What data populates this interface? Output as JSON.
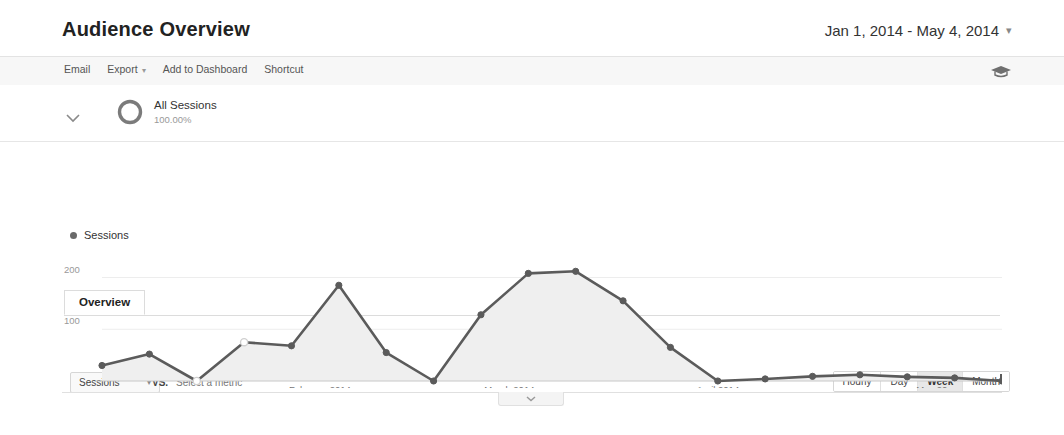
{
  "header": {
    "title": "Audience Overview",
    "date_range": "Jan 1, 2014 - May 4, 2014",
    "date_range_caret": "▾"
  },
  "toolbar": {
    "items": [
      {
        "label": "Email",
        "has_caret": false
      },
      {
        "label": "Export",
        "has_caret": true
      },
      {
        "label": "Add to Dashboard",
        "has_caret": false
      },
      {
        "label": "Shortcut",
        "has_caret": false
      }
    ],
    "export_caret": "▾",
    "help_icon": "graduation-cap-icon"
  },
  "segment": {
    "chevron_icon": "chevron-down-icon",
    "ring_icon": "donut-ring-icon",
    "name": "All Sessions",
    "percent": "100.00%"
  },
  "tabs": [
    {
      "label": "Overview",
      "active": true
    }
  ],
  "metric_controls": {
    "selected_metric": "Sessions",
    "metric_caret": "▾",
    "vs_label": "VS.",
    "compare_placeholder": "Select a metric",
    "granularity": [
      {
        "label": "Hourly",
        "active": false
      },
      {
        "label": "Day",
        "active": false
      },
      {
        "label": "Week",
        "active": true
      },
      {
        "label": "Month",
        "active": false
      }
    ]
  },
  "legend": {
    "series_label": "Sessions",
    "dot_color": "#6a6a6a"
  },
  "colors": {
    "line": "#5b5b5b",
    "fill": "#efefef",
    "axis": "#c8c8c8",
    "grid": "#ededed",
    "marker": "#5b5b5b",
    "marker_zero": "#ffffff"
  },
  "chart_data": {
    "type": "area",
    "title": "",
    "xlabel": "",
    "ylabel": "Sessions",
    "ylim": [
      0,
      230
    ],
    "yticks": [
      100,
      200
    ],
    "ytick_labels": [
      "100",
      "200"
    ],
    "grid": true,
    "legend_position": "top-left",
    "x_axis_labels": [
      {
        "label": "February 2014",
        "x_value": 4.6
      },
      {
        "label": "March 2014",
        "x_value": 8.6
      },
      {
        "label": "April 2014",
        "x_value": 13.0
      },
      {
        "label": "May 20...",
        "x_value": 17.6
      }
    ],
    "series": [
      {
        "name": "Sessions",
        "values": [
          30,
          52,
          0,
          75,
          68,
          185,
          55,
          0,
          128,
          208,
          212,
          155,
          65,
          0,
          4,
          9,
          12,
          8,
          6,
          0
        ]
      }
    ],
    "zero_markers_hollow": [
      2,
      3
    ]
  },
  "bottom": {
    "collapse_handle_icon": "chevron-down-icon"
  }
}
